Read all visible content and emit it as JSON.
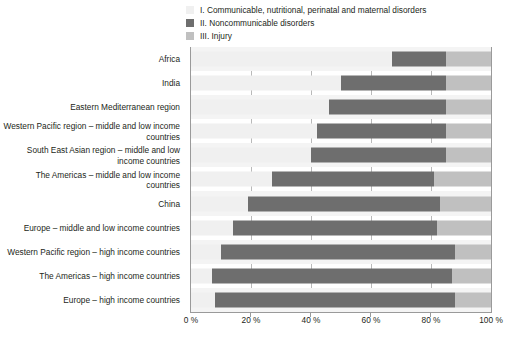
{
  "legend": {
    "items": [
      {
        "id": "class-i",
        "label": "I. Communicable, nutritional, perinatal and maternal disorders",
        "color": "#f0f0f0"
      },
      {
        "id": "class-ii",
        "label": "II. Noncommunicable disorders",
        "color": "#6e6e6e"
      },
      {
        "id": "class-iii",
        "label": "III. Injury",
        "color": "#c0c0c0"
      }
    ]
  },
  "chart_data": {
    "type": "bar",
    "orientation": "horizontal",
    "stacked": true,
    "stack_total": 100,
    "title": "",
    "xlabel": "",
    "ylabel": "",
    "xlim": [
      0,
      100
    ],
    "grid": true,
    "legend_position": "top",
    "xticks": [
      0,
      20,
      40,
      60,
      80,
      100
    ],
    "xtick_labels": [
      "0 %",
      "20 %",
      "40 %",
      "60 %",
      "80 %",
      "100 %"
    ],
    "categories": [
      "Africa",
      "India",
      "Eastern Mediterranean region",
      "Western Pacific region – middle and low income countries",
      "South East Asian region – middle and low income countries",
      "The Americas – middle and low income countries",
      "China",
      "Europe – middle and low income countries",
      "Western Pacific region – high income countries",
      "The Americas – high income countries",
      "Europe – high income countries"
    ],
    "series": [
      {
        "name": "I. Communicable, nutritional, perinatal and maternal disorders",
        "color": "#f0f0f0",
        "values": [
          67,
          50,
          46,
          42,
          40,
          27,
          19,
          14,
          10,
          7,
          8
        ]
      },
      {
        "name": "II. Noncommunicable disorders",
        "color": "#6e6e6e",
        "values": [
          18,
          35,
          39,
          43,
          45,
          54,
          64,
          68,
          78,
          80,
          80
        ]
      },
      {
        "name": "III. Injury",
        "color": "#c0c0c0",
        "values": [
          15,
          15,
          15,
          15,
          15,
          19,
          17,
          18,
          12,
          13,
          12
        ]
      }
    ]
  },
  "colors": {
    "axis": "#9a9a9a",
    "gridline": "#b9b9b9",
    "row_alt": "#f4f4f4",
    "text": "#231f20",
    "background": "#ffffff"
  }
}
